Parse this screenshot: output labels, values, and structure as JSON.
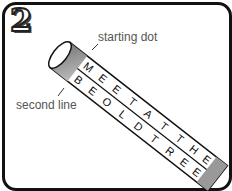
{
  "figure": {
    "step_number": "2",
    "labels": {
      "starting_dot": "starting dot",
      "second_line": "second line"
    },
    "strip": {
      "line1": [
        "M",
        "E",
        "E",
        "T",
        "A",
        "T",
        "T",
        "H",
        "E"
      ],
      "line2": [
        "B",
        "E",
        "O",
        "L",
        "D",
        "T",
        "R",
        "E",
        "E"
      ]
    },
    "colors": {
      "border": "#111111",
      "cylinder_shade": "#8a8a8a",
      "text": "#555555"
    }
  }
}
